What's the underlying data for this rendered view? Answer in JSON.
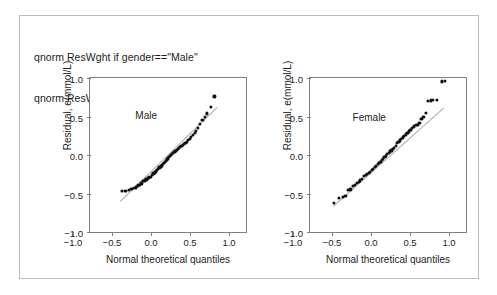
{
  "figure": {
    "command_lines": [
      "qnorm ResWght if gender==\"Male\"",
      "qnorm ResWght if gender==\"Female\""
    ],
    "frame_color": "#b9bcc0",
    "axis_color": "#7d7f83",
    "point_color": "#121212",
    "reference_line_color": "#a9abae"
  },
  "chart_data": [
    {
      "type": "scatter",
      "title": "Male",
      "xlabel": "Normal theoretical quantiles",
      "ylabel": "Residual, e(mmol/L)",
      "xlim": [
        -1.0,
        1.0
      ],
      "ylim": [
        -1.0,
        1.0
      ],
      "xticks": [
        -1.0,
        -0.5,
        0.0,
        0.5,
        1.0
      ],
      "yticks": [
        -1.0,
        -0.5,
        0.0,
        0.5,
        1.0
      ],
      "xtick_labels": [
        "-1.0",
        "-0.5",
        "0.0",
        "0.5",
        "1.0"
      ],
      "ytick_labels": [
        "-1.0",
        "-0.5",
        "0.0",
        "0.5",
        "1.0"
      ],
      "grid": false,
      "legend": "none",
      "title_position": [
        -0.28,
        0.52
      ],
      "reference_line": {
        "x": [
          -0.62,
          0.62
        ],
        "y": [
          -0.6,
          0.62
        ]
      },
      "x": [
        -0.595,
        -0.545,
        -0.5,
        -0.47,
        -0.442,
        -0.412,
        -0.388,
        -0.362,
        -0.34,
        -0.318,
        -0.298,
        -0.278,
        -0.258,
        -0.24,
        -0.222,
        -0.205,
        -0.188,
        -0.172,
        -0.156,
        -0.14,
        -0.125,
        -0.11,
        -0.096,
        -0.082,
        -0.068,
        -0.054,
        -0.04,
        -0.027,
        -0.013,
        0.0,
        0.013,
        0.027,
        0.04,
        0.054,
        0.068,
        0.082,
        0.096,
        0.11,
        0.125,
        0.14,
        0.156,
        0.172,
        0.188,
        0.205,
        0.222,
        0.24,
        0.258,
        0.278,
        0.298,
        0.318,
        0.34,
        0.362,
        0.388,
        0.412,
        0.442,
        0.47,
        0.5,
        0.545,
        0.595
      ],
      "y": [
        -0.47,
        -0.47,
        -0.455,
        -0.44,
        -0.43,
        -0.42,
        -0.395,
        -0.39,
        -0.37,
        -0.34,
        -0.33,
        -0.318,
        -0.3,
        -0.292,
        -0.28,
        -0.258,
        -0.24,
        -0.225,
        -0.212,
        -0.196,
        -0.18,
        -0.162,
        -0.148,
        -0.136,
        -0.12,
        -0.104,
        -0.09,
        -0.074,
        -0.058,
        -0.044,
        -0.03,
        -0.014,
        0.0,
        0.012,
        0.026,
        0.038,
        0.052,
        0.064,
        0.076,
        0.09,
        0.102,
        0.116,
        0.128,
        0.142,
        0.158,
        0.174,
        0.192,
        0.212,
        0.232,
        0.258,
        0.286,
        0.316,
        0.35,
        0.4,
        0.452,
        0.5,
        0.54,
        0.62,
        0.76
      ]
    },
    {
      "type": "scatter",
      "title": "Female",
      "xlabel": "Normal theoretical quantiles",
      "ylabel": "Residual, e(mmol/L)",
      "xlim": [
        -1.0,
        1.0
      ],
      "ylim": [
        -1.0,
        1.0
      ],
      "xticks": [
        -1.0,
        -0.5,
        0.0,
        0.5,
        1.0
      ],
      "yticks": [
        -1.0,
        -0.5,
        0.0,
        0.5,
        1.0
      ],
      "xtick_labels": [
        "-1.0",
        "-0.5",
        "0.0",
        "0.5",
        "1.0"
      ],
      "ytick_labels": [
        "-1.0",
        "-0.5",
        "0.0",
        "0.5",
        "1.0"
      ],
      "grid": false,
      "legend": "none",
      "title_position": [
        -0.24,
        0.5
      ],
      "reference_line": {
        "x": [
          -0.7,
          0.72
        ],
        "y": [
          -0.66,
          0.62
        ]
      },
      "x": [
        -0.69,
        -0.625,
        -0.58,
        -0.545,
        -0.512,
        -0.482,
        -0.455,
        -0.428,
        -0.402,
        -0.378,
        -0.355,
        -0.332,
        -0.31,
        -0.288,
        -0.268,
        -0.248,
        -0.228,
        -0.208,
        -0.19,
        -0.17,
        -0.152,
        -0.134,
        -0.116,
        -0.098,
        -0.08,
        -0.062,
        -0.045,
        -0.028,
        -0.01,
        0.008,
        0.026,
        0.044,
        0.062,
        0.08,
        0.098,
        0.116,
        0.134,
        0.152,
        0.17,
        0.19,
        0.208,
        0.228,
        0.248,
        0.268,
        0.288,
        0.31,
        0.332,
        0.355,
        0.378,
        0.402,
        0.428,
        0.455,
        0.482,
        0.512,
        0.545,
        0.58,
        0.625,
        0.69,
        0.725
      ],
      "y": [
        -0.62,
        -0.56,
        -0.54,
        -0.53,
        -0.455,
        -0.448,
        -0.4,
        -0.388,
        -0.362,
        -0.35,
        -0.33,
        -0.312,
        -0.275,
        -0.262,
        -0.25,
        -0.23,
        -0.215,
        -0.196,
        -0.182,
        -0.15,
        -0.138,
        -0.12,
        -0.106,
        -0.092,
        -0.06,
        -0.048,
        -0.03,
        -0.008,
        0.01,
        0.028,
        0.046,
        0.06,
        0.078,
        0.095,
        0.115,
        0.16,
        0.175,
        0.19,
        0.208,
        0.228,
        0.252,
        0.268,
        0.29,
        0.306,
        0.33,
        0.35,
        0.372,
        0.388,
        0.392,
        0.42,
        0.465,
        0.5,
        0.55,
        0.7,
        0.71,
        0.718,
        0.72,
        0.955,
        0.96
      ]
    }
  ]
}
